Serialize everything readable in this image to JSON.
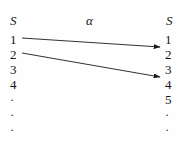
{
  "figure": {
    "domain_label": "S",
    "codomain_label": "S",
    "map_label": "α",
    "background_color": "#fefefe",
    "ink_color": "#1a1a1a"
  },
  "domain_column": {
    "name": "S",
    "items": [
      {
        "label": "1"
      },
      {
        "label": "2"
      },
      {
        "label": "3"
      },
      {
        "label": "4"
      },
      {
        "label": "·"
      },
      {
        "label": "·"
      },
      {
        "label": "·"
      }
    ]
  },
  "codomain_column": {
    "name": "S",
    "items": [
      {
        "label": "1"
      },
      {
        "label": "2"
      },
      {
        "label": "3"
      },
      {
        "label": "4"
      },
      {
        "label": "5"
      },
      {
        "label": "·"
      },
      {
        "label": "·"
      }
    ]
  },
  "arrows": [
    {
      "from": "1",
      "to": "2",
      "x1": 22,
      "y1": 38,
      "x2": 160,
      "y2": 47
    },
    {
      "from": "2",
      "to": "4",
      "x1": 22,
      "y1": 53,
      "x2": 160,
      "y2": 77
    }
  ]
}
